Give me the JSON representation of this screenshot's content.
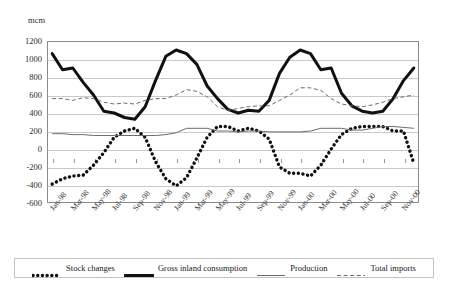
{
  "chart_title": "",
  "unit_label": "mcm",
  "axis": {
    "ylabel": "mcm",
    "ytick_labels": [
      "1200",
      "1000",
      "800",
      "600",
      "400",
      "200",
      "0",
      "-200",
      "-400",
      "-600"
    ],
    "ylim": [
      -600,
      1200
    ],
    "ystep": 200,
    "grid": true
  },
  "legend": {
    "position": "bottom",
    "entries": [
      {
        "label": "Stock changes",
        "style": "thick-dotted",
        "color": "#111111"
      },
      {
        "label": "Gross inland consumption",
        "style": "thick-solid",
        "color": "#111111"
      },
      {
        "label": "Production",
        "style": "thin-solid",
        "color": "#6b6b6b"
      },
      {
        "label": "Total imports",
        "style": "thin-dashed",
        "color": "#6b6b6b"
      }
    ]
  },
  "chart_data": {
    "type": "line",
    "title": "",
    "xlabel": "",
    "ylabel": "mcm",
    "ylim": [
      -600,
      1200
    ],
    "ystep": 200,
    "grid": true,
    "legend_position": "bottom",
    "x": [
      "Jan-98",
      "Feb-98",
      "Mar-98",
      "Apr-98",
      "May-98",
      "Jun-98",
      "Jul-98",
      "Aug-98",
      "Sep-98",
      "Oct-98",
      "Nov-98",
      "Dec-98",
      "Jan-99",
      "Feb-99",
      "Mar-99",
      "Apr-99",
      "May-99",
      "Jun-99",
      "Jul-99",
      "Aug-99",
      "Sep-99",
      "Oct-99",
      "Nov-99",
      "Dec-99",
      "Jan-00",
      "Feb-00",
      "Mar-00",
      "Apr-00",
      "May-00",
      "Jun-00",
      "Jul-00",
      "Aug-00",
      "Sep-00",
      "Oct-00",
      "Nov-00",
      "Dec-00"
    ],
    "tick_labels": [
      "Jan-98",
      "Mar-98",
      "May-98",
      "Jul-98",
      "Sep-98",
      "Nov-98",
      "Jan-99",
      "Mar-99",
      "May-99",
      "Jul-99",
      "Sep-99",
      "Nov-99",
      "Jan-00",
      "Mar-00",
      "May-00",
      "Jul-00",
      "Sep-00",
      "Nov-00"
    ],
    "tick_every": 2,
    "series": [
      {
        "name": "Stock changes",
        "style": "thick-dotted",
        "color": "#111111",
        "values": [
          -390,
          -330,
          -300,
          -290,
          -180,
          -40,
          130,
          200,
          230,
          130,
          -140,
          -330,
          -410,
          -320,
          -100,
          130,
          250,
          250,
          200,
          230,
          200,
          110,
          -200,
          -270,
          -270,
          -300,
          -180,
          0,
          160,
          230,
          250,
          250,
          250,
          200,
          200,
          -160
        ]
      },
      {
        "name": "Gross inland consumption",
        "style": "thick-solid",
        "color": "#111111",
        "values": [
          1060,
          880,
          900,
          740,
          600,
          420,
          400,
          350,
          330,
          470,
          760,
          1030,
          1100,
          1060,
          940,
          700,
          560,
          440,
          400,
          430,
          420,
          540,
          840,
          1020,
          1100,
          1060,
          880,
          900,
          620,
          480,
          420,
          400,
          420,
          560,
          760,
          900
        ]
      },
      {
        "name": "Production",
        "style": "thin-solid",
        "color": "#6b6b6b",
        "values": [
          170,
          170,
          160,
          160,
          150,
          150,
          150,
          150,
          150,
          150,
          150,
          160,
          180,
          230,
          230,
          230,
          200,
          200,
          190,
          200,
          200,
          190,
          190,
          190,
          190,
          200,
          230,
          230,
          230,
          210,
          210,
          230,
          250,
          250,
          240,
          230
        ]
      },
      {
        "name": "Total imports",
        "style": "thin-dashed",
        "color": "#6b6b6b",
        "values": [
          560,
          560,
          540,
          570,
          560,
          520,
          500,
          510,
          500,
          540,
          560,
          560,
          600,
          660,
          640,
          580,
          470,
          430,
          450,
          470,
          480,
          480,
          540,
          600,
          680,
          680,
          650,
          560,
          500,
          480,
          470,
          490,
          520,
          560,
          580,
          600
        ]
      }
    ]
  }
}
